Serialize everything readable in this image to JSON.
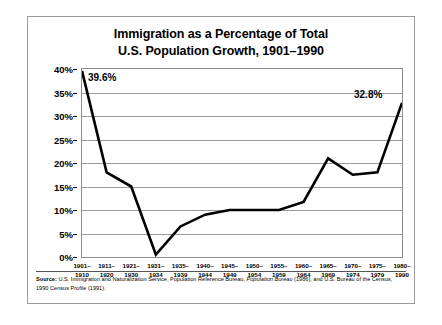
{
  "figure": {
    "title_line1": "Immigration as a Percentage of Total",
    "title_line2": "U.S. Population Growth, 1901–1990",
    "source_label": "Source:",
    "source_text_part1": "U.S. Immigration and Naturalization Service, Population Reference Bureau, ",
    "source_italic": "Population Bureau",
    "source_text_part2": " (1986), and U.S. Bureau of the Census, 1990 Census Profile (1991)."
  },
  "chart_data": {
    "type": "line",
    "title": "Immigration as a Percentage of Total U.S. Population Growth, 1901–1990",
    "xlabel": "",
    "ylabel": "",
    "ylim": [
      0,
      40
    ],
    "ytick_values": [
      0,
      5,
      10,
      15,
      20,
      25,
      30,
      35,
      40
    ],
    "ytick_labels": [
      "0%",
      "5%",
      "10%",
      "15%",
      "20%",
      "25%",
      "30%",
      "35%",
      "40%"
    ],
    "grid": true,
    "legend": "none",
    "categories": [
      "1901–1910",
      "1911–1920",
      "1921–1930",
      "1931–1934",
      "1935–1939",
      "1940–1944",
      "1945–1949",
      "1950–1954",
      "1955–1959",
      "1960–1964",
      "1965–1969",
      "1970–1974",
      "1975–1979",
      "1980–1990"
    ],
    "categories_top": [
      "1901–",
      "1911–",
      "1921–",
      "1931–",
      "1935–",
      "1940–",
      "1945–",
      "1950–",
      "1955–",
      "1960–",
      "1965–",
      "1970–",
      "1975–",
      "1980–"
    ],
    "categories_bottom": [
      "1910",
      "1920",
      "1930",
      "1934",
      "1939",
      "1944",
      "1949",
      "1954",
      "1959",
      "1964",
      "1969",
      "1974",
      "1979",
      "1990"
    ],
    "values": [
      39.6,
      18.0,
      15.0,
      0.5,
      6.5,
      9.0,
      10.0,
      10.0,
      10.0,
      11.7,
      21.0,
      17.5,
      18.0,
      32.8
    ],
    "annotations": [
      {
        "label": "39.6%",
        "index": 0,
        "value": 39.6
      },
      {
        "label": "32.8%",
        "index": 13,
        "value": 32.8
      }
    ],
    "line_color": "#000000",
    "grid_color": "#9b9b9b",
    "background_color": "#ffffff"
  }
}
